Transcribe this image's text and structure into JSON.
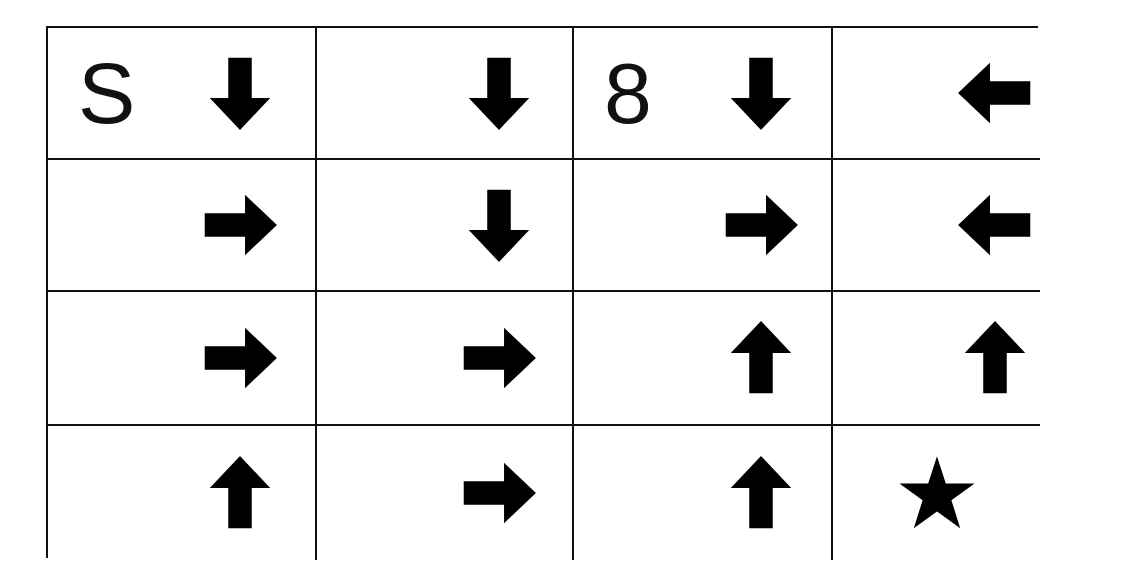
{
  "grid": {
    "rows": 4,
    "cols": 4,
    "cells": [
      [
        {
          "label": "S",
          "icon": "arrow-down"
        },
        {
          "label": "",
          "icon": "arrow-down"
        },
        {
          "label": "8",
          "icon": "arrow-down"
        },
        {
          "label": "",
          "icon": "arrow-left"
        }
      ],
      [
        {
          "label": "",
          "icon": "arrow-right"
        },
        {
          "label": "",
          "icon": "arrow-down"
        },
        {
          "label": "",
          "icon": "arrow-right"
        },
        {
          "label": "",
          "icon": "arrow-left"
        }
      ],
      [
        {
          "label": "",
          "icon": "arrow-right"
        },
        {
          "label": "",
          "icon": "arrow-right"
        },
        {
          "label": "",
          "icon": "arrow-up"
        },
        {
          "label": "",
          "icon": "arrow-up"
        }
      ],
      [
        {
          "label": "",
          "icon": "arrow-up"
        },
        {
          "label": "",
          "icon": "arrow-right"
        },
        {
          "label": "",
          "icon": "arrow-up"
        },
        {
          "label": "",
          "icon": "star"
        }
      ]
    ]
  },
  "colors": {
    "line": "#111111",
    "glyph": "#000000",
    "background": "#ffffff"
  }
}
